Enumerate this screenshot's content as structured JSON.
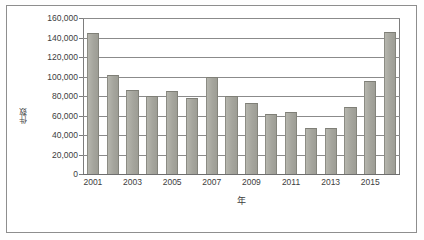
{
  "figure": {
    "frame_color": "#8e8e8e",
    "background": "#ffffff"
  },
  "chart_data": {
    "type": "bar",
    "title": "",
    "subtitle": "",
    "xlabel": "年",
    "ylabel": "件数",
    "categories": [
      "2001",
      "2002",
      "2003",
      "2004",
      "2005",
      "2006",
      "2007",
      "2008",
      "2009",
      "2010",
      "2011",
      "2012",
      "2013",
      "2014",
      "2015",
      "2016"
    ],
    "values": [
      145000,
      102000,
      86000,
      80500,
      85500,
      77500,
      99000,
      80500,
      72500,
      61500,
      63500,
      47000,
      47500,
      68500,
      95500,
      145500
    ],
    "series": [
      {
        "name": "件数",
        "values": [
          145000,
          102000,
          86000,
          80500,
          85500,
          77500,
          99000,
          80500,
          72500,
          61500,
          63500,
          47000,
          47500,
          68500,
          95500,
          145500
        ]
      }
    ],
    "ylim": [
      0,
      160000
    ],
    "ytick_values": [
      0,
      20000,
      40000,
      60000,
      80000,
      100000,
      120000,
      140000,
      160000
    ],
    "ytick_labels": [
      "0",
      "20,000",
      "40,000",
      "60,000",
      "80,000",
      "100,000",
      "120,000",
      "140,000",
      "160,000"
    ],
    "xtick_labels": [
      "2001",
      "2003",
      "2005",
      "2007",
      "2009",
      "2011",
      "2013",
      "2015"
    ],
    "xtick_categories": [
      "2001",
      "2003",
      "2005",
      "2007",
      "2009",
      "2011",
      "2013",
      "2015"
    ],
    "grid": true,
    "grid_axis": "y",
    "legend": false,
    "legend_position": "none",
    "bar_color": "#a8a8a0",
    "bar_edge_color": "#848478",
    "gridline_color": "#8b8b8b",
    "annotations": []
  }
}
